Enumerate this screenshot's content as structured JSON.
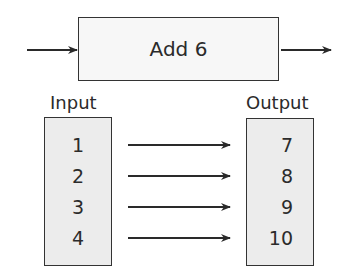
{
  "diagram": {
    "function_label": "Add 6",
    "input_label": "Input",
    "output_label": "Output",
    "inputs": [
      "1",
      "2",
      "3",
      "4"
    ],
    "outputs": [
      "7",
      "8",
      "9",
      "10"
    ]
  },
  "colors": {
    "stroke": "#2a2a2a",
    "function_box_fill": "#f7f7f7",
    "column_box_fill": "#ececec",
    "background": "#ffffff"
  }
}
